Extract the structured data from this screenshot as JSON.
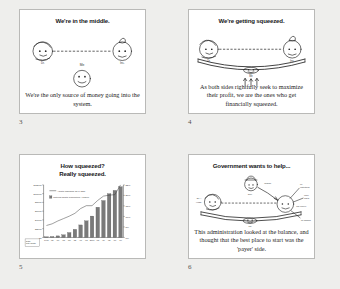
{
  "document": {
    "background_color": "#eeeeec",
    "panel_background": "#ffffff",
    "panel_border_color": "#b9b9b7",
    "ink_color": "#1b1b1b"
  },
  "panels": [
    {
      "page_number": "3",
      "title": "We're in the middle.",
      "caption": "We're the only source of money going into the system.",
      "figure_labels": {
        "left": "Dr.",
        "right": "Ins.",
        "center": "Me"
      }
    },
    {
      "page_number": "4",
      "title": "We're getting squeezed.",
      "caption": "As both sides rightfully seek to maximize their profit, we are the ones who get financially squeezed.",
      "figure_labels": {
        "left": "Dr.",
        "right": "Ins.",
        "center": "Me"
      }
    },
    {
      "page_number": "5",
      "title_line1": "How squeezed?",
      "title_line2": "Really squeezed.",
      "caption": ""
    },
    {
      "page_number": "6",
      "title": "Government wants to help...",
      "caption": "This administration looked at the balance, and thought that the best place to start was the 'payer' side.",
      "figure_labels": {
        "left": "Dr.",
        "right": "Ins.",
        "center": "Me",
        "gov": "Gov."
      }
    }
  ],
  "chart_data": {
    "type": "bar",
    "title": "How squeezed? Really squeezed.",
    "xlabel": "",
    "ylabel": "",
    "grid": false,
    "legend_position": "upper-left",
    "legend": [
      "Health insurance as % GDP",
      "National health expenditure / person"
    ],
    "categories": [
      "1960",
      "'65",
      "'70",
      "'75",
      "'80",
      "'85",
      "'90",
      "'95",
      "2000",
      "'05",
      "'10",
      "'15",
      "'17",
      "'19"
    ],
    "series": [
      {
        "name": "National health expenditure / person",
        "type": "bar",
        "values": [
          146,
          205,
          355,
          605,
          1110,
          1850,
          2855,
          3790,
          4880,
          6900,
          8420,
          9990,
          10740,
          11580
        ],
        "axis": "left",
        "ylim": [
          0,
          12000
        ],
        "yticks": [
          "$12000",
          "$10000",
          "$8000",
          "$6000",
          "$4000",
          "$2000",
          "$0"
        ],
        "color": "#7a7a7a"
      },
      {
        "name": "Health insurance as % GDP",
        "type": "line",
        "values": [
          5.0,
          5.7,
          6.9,
          7.9,
          8.9,
          10.1,
          12.1,
          13.3,
          13.3,
          15.5,
          17.3,
          17.7,
          17.9,
          22.0
        ],
        "axis": "right",
        "ylim": [
          0,
          22
        ],
        "yticks": [
          "22%",
          "20%",
          "15%",
          "10%",
          "5%",
          "0%"
        ],
        "color": "#3a3a3a"
      }
    ],
    "corner_note": "Data: Nat'l health expenditure"
  }
}
